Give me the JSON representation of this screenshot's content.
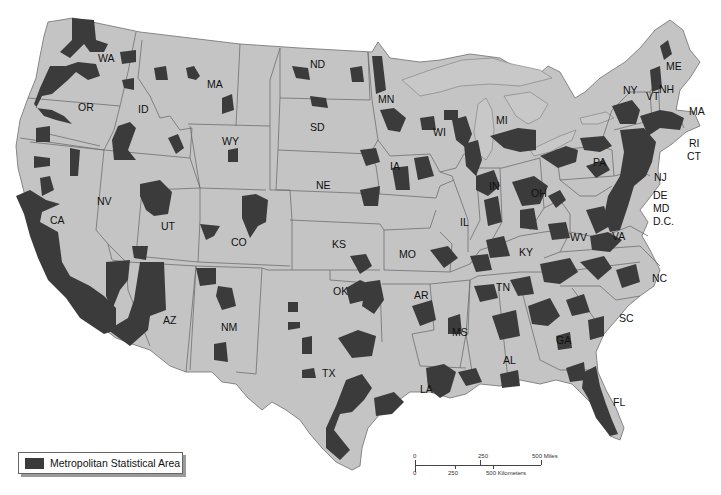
{
  "map": {
    "title_fragment": "",
    "colors": {
      "state_fill": "#c4c4c4",
      "state_stroke": "#6e6e6e",
      "metro_fill": "#3b3b3b",
      "background": "#ffffff"
    },
    "state_labels": [
      {
        "abbr": "WA",
        "x": 98,
        "y": 62
      },
      {
        "abbr": "OR",
        "x": 78,
        "y": 111
      },
      {
        "abbr": "ID",
        "x": 138,
        "y": 113
      },
      {
        "abbr": "MA",
        "x": 207,
        "y": 88
      },
      {
        "abbr": "WY",
        "x": 222,
        "y": 145
      },
      {
        "abbr": "CA",
        "x": 50,
        "y": 224
      },
      {
        "abbr": "NV",
        "x": 97,
        "y": 205
      },
      {
        "abbr": "UT",
        "x": 161,
        "y": 230
      },
      {
        "abbr": "CO",
        "x": 231,
        "y": 246
      },
      {
        "abbr": "AZ",
        "x": 163,
        "y": 324
      },
      {
        "abbr": "NM",
        "x": 221,
        "y": 331
      },
      {
        "abbr": "ND",
        "x": 310,
        "y": 68
      },
      {
        "abbr": "SD",
        "x": 310,
        "y": 131
      },
      {
        "abbr": "NE",
        "x": 316,
        "y": 189
      },
      {
        "abbr": "KS",
        "x": 332,
        "y": 248
      },
      {
        "abbr": "OK",
        "x": 333,
        "y": 295
      },
      {
        "abbr": "TX",
        "x": 322,
        "y": 377
      },
      {
        "abbr": "MN",
        "x": 378,
        "y": 103
      },
      {
        "abbr": "IA",
        "x": 390,
        "y": 170
      },
      {
        "abbr": "MO",
        "x": 399,
        "y": 258
      },
      {
        "abbr": "AR",
        "x": 414,
        "y": 299
      },
      {
        "abbr": "LA",
        "x": 420,
        "y": 393
      },
      {
        "abbr": "WI",
        "x": 433,
        "y": 136
      },
      {
        "abbr": "IL",
        "x": 460,
        "y": 226
      },
      {
        "abbr": "MI",
        "x": 496,
        "y": 124
      },
      {
        "abbr": "IN",
        "x": 489,
        "y": 190
      },
      {
        "abbr": "OH",
        "x": 531,
        "y": 197
      },
      {
        "abbr": "KY",
        "x": 519,
        "y": 256
      },
      {
        "abbr": "TN",
        "x": 496,
        "y": 291
      },
      {
        "abbr": "MS",
        "x": 452,
        "y": 336
      },
      {
        "abbr": "AL",
        "x": 503,
        "y": 364
      },
      {
        "abbr": "GA",
        "x": 556,
        "y": 344
      },
      {
        "abbr": "FL",
        "x": 613,
        "y": 406
      },
      {
        "abbr": "SC",
        "x": 619,
        "y": 322
      },
      {
        "abbr": "NC",
        "x": 652,
        "y": 282
      },
      {
        "abbr": "WV",
        "x": 570,
        "y": 241
      },
      {
        "abbr": "VA",
        "x": 612,
        "y": 240
      },
      {
        "abbr": "PA",
        "x": 593,
        "y": 166
      },
      {
        "abbr": "NY",
        "x": 623,
        "y": 94
      },
      {
        "abbr": "VT",
        "x": 646,
        "y": 100
      },
      {
        "abbr": "NH",
        "x": 659,
        "y": 93
      },
      {
        "abbr": "ME",
        "x": 666,
        "y": 70
      },
      {
        "abbr": "MA",
        "x": 689,
        "y": 115
      },
      {
        "abbr": "RI",
        "x": 689,
        "y": 147
      },
      {
        "abbr": "CT",
        "x": 687,
        "y": 160
      },
      {
        "abbr": "NJ",
        "x": 654,
        "y": 181
      },
      {
        "abbr": "DE",
        "x": 653,
        "y": 199
      },
      {
        "abbr": "MD",
        "x": 653,
        "y": 212
      },
      {
        "abbr": "D.C.",
        "x": 653,
        "y": 225
      }
    ]
  },
  "legend": {
    "label": "Metropolitan Statistical Area",
    "swatch_color": "#3b3b3b"
  },
  "scale_bar": {
    "miles": {
      "labels": [
        "0",
        "250",
        "500 Miles"
      ]
    },
    "kilometers": {
      "labels": [
        "0",
        "250",
        "500 Kilometers"
      ]
    }
  }
}
